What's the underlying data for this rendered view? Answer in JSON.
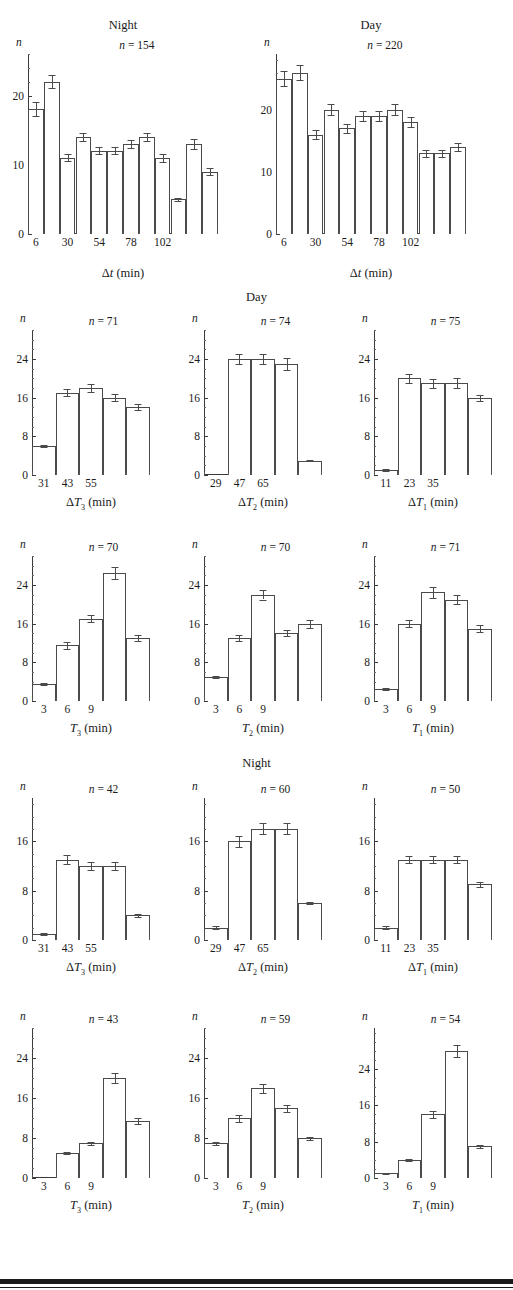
{
  "section_headings": [
    {
      "text": "Day",
      "row": 2
    },
    {
      "text": "Night",
      "row": 4
    }
  ],
  "axis_common": {
    "y_axis_label": "n",
    "n_prefix": "n",
    "n_equals": "="
  },
  "chart_data": [
    {
      "id": "night-dt",
      "type": "bar",
      "title": "Night",
      "n_label": "n = 154",
      "n_value": 154,
      "xlabel": "Δt (min)",
      "xlabel_html": "Δ<i>t</i> (min)",
      "ylabel": "n",
      "ylim": [
        0,
        26
      ],
      "yticks": [
        0,
        10,
        20
      ],
      "ytick_labels": [
        "0",
        "10",
        "20"
      ],
      "xticks": [
        6,
        30,
        54,
        78,
        102
      ],
      "xtick_labels": [
        "6",
        "30",
        "54",
        "78",
        "102"
      ],
      "x_min": 0,
      "x_max": 144,
      "bin_width": 12,
      "categories": [
        "0-12",
        "12-24",
        "24-36",
        "36-48",
        "48-60",
        "60-72",
        "72-84",
        "84-96",
        "96-108",
        "108-120",
        "120-132",
        "132-144"
      ],
      "values": [
        18,
        22,
        11,
        14,
        12,
        12,
        13,
        14,
        11,
        5,
        13,
        9
      ],
      "errors": [
        1.0,
        0.9,
        0.5,
        0.6,
        0.5,
        0.5,
        0.6,
        0.6,
        0.6,
        0.2,
        0.7,
        0.5
      ],
      "grid": false,
      "legend": "none"
    },
    {
      "id": "day-dt",
      "type": "bar",
      "title": "Day",
      "n_label": "n = 220",
      "n_value": 220,
      "xlabel": "Δt (min)",
      "xlabel_html": "Δ<i>t</i> (min)",
      "ylabel": "n",
      "ylim": [
        0,
        29
      ],
      "yticks": [
        0,
        10,
        20
      ],
      "ytick_labels": [
        "0",
        "10",
        "20"
      ],
      "xticks": [
        6,
        30,
        54,
        78,
        102
      ],
      "xtick_labels": [
        "6",
        "30",
        "54",
        "78",
        "102"
      ],
      "x_min": 0,
      "x_max": 144,
      "bin_width": 12,
      "categories": [
        "0-12",
        "12-24",
        "24-36",
        "36-48",
        "48-60",
        "60-72",
        "72-84",
        "84-96",
        "96-108",
        "108-120",
        "120-132",
        "132-144"
      ],
      "values": [
        25,
        26,
        16,
        20,
        17,
        19,
        19,
        20,
        18,
        13,
        13,
        14
      ],
      "errors": [
        1.2,
        1.2,
        0.7,
        0.9,
        0.7,
        0.8,
        0.8,
        0.9,
        0.8,
        0.6,
        0.6,
        0.7
      ],
      "grid": false,
      "legend": "none"
    },
    {
      "id": "day-dT3",
      "type": "bar",
      "title": "",
      "n_label": "n = 71",
      "n_value": 71,
      "xlabel": "ΔT3 (min)",
      "xlabel_html": "Δ<i>T</i><sub>3</sub> (min)",
      "ylabel": "n",
      "ylim": [
        0,
        30
      ],
      "yticks": [
        0,
        8,
        16,
        24
      ],
      "ytick_labels": [
        "0",
        "8",
        "16",
        "24"
      ],
      "xticks": [
        31,
        43,
        55
      ],
      "xtick_labels": [
        "31",
        "43",
        "55"
      ],
      "x_min": 25,
      "x_max": 85,
      "bin_width": 12,
      "categories": [
        "25-37",
        "37-49",
        "49-61",
        "61-73",
        "73-85"
      ],
      "values": [
        6,
        17,
        18,
        16,
        14
      ],
      "errors": [
        0.2,
        0.7,
        0.9,
        0.7,
        0.6
      ],
      "grid": false,
      "legend": "none"
    },
    {
      "id": "day-dT2",
      "type": "bar",
      "title": "",
      "n_label": "n = 74",
      "n_value": 74,
      "xlabel": "ΔT2 (min)",
      "xlabel_html": "Δ<i>T</i><sub>2</sub> (min)",
      "ylabel": "n",
      "ylim": [
        0,
        30
      ],
      "yticks": [
        0,
        8,
        16,
        24
      ],
      "ytick_labels": [
        "0",
        "8",
        "16",
        "24"
      ],
      "xticks": [
        29,
        47,
        65
      ],
      "xtick_labels": [
        "29",
        "47",
        "65"
      ],
      "x_min": 20,
      "x_max": 110,
      "bin_width": 18,
      "categories": [
        "20-38",
        "38-56",
        "56-74",
        "74-92",
        "92-110"
      ],
      "values": [
        0,
        24,
        24,
        23,
        3
      ],
      "errors": [
        0,
        1.0,
        1.1,
        1.2,
        0.2
      ],
      "grid": false,
      "legend": "none"
    },
    {
      "id": "day-dT1",
      "type": "bar",
      "title": "",
      "n_label": "n = 75",
      "n_value": 75,
      "xlabel": "ΔT1 (min)",
      "xlabel_html": "Δ<i>T</i><sub>1</sub> (min)",
      "ylabel": "n",
      "ylim": [
        0,
        30
      ],
      "yticks": [
        0,
        8,
        16,
        24
      ],
      "ytick_labels": [
        "0",
        "8",
        "16",
        "24"
      ],
      "xticks": [
        11,
        23,
        35
      ],
      "xtick_labels": [
        "11",
        "23",
        "35"
      ],
      "x_min": 5,
      "x_max": 65,
      "bin_width": 12,
      "categories": [
        "5-17",
        "17-29",
        "29-41",
        "41-53",
        "53-65"
      ],
      "values": [
        1,
        20,
        19,
        19,
        16
      ],
      "errors": [
        0.2,
        1.0,
        0.9,
        1.0,
        0.6
      ],
      "grid": false,
      "legend": "none"
    },
    {
      "id": "day-T3",
      "type": "bar",
      "title": "",
      "n_label": "n = 70",
      "n_value": 70,
      "xlabel": "T3 (min)",
      "xlabel_html": "<i>T</i><sub>3</sub> (min)",
      "ylabel": "n",
      "ylim": [
        0,
        30
      ],
      "yticks": [
        0,
        8,
        16,
        24
      ],
      "ytick_labels": [
        "0",
        "8",
        "16",
        "24"
      ],
      "xticks": [
        3,
        6,
        9
      ],
      "xtick_labels": [
        "3",
        "6",
        "9"
      ],
      "x_min": 1.5,
      "x_max": 16.5,
      "bin_width": 3,
      "categories": [
        "1.5-4.5",
        "4.5-7.5",
        "7.5-10.5",
        "10.5-13.5",
        "13.5-16.5"
      ],
      "values": [
        3.5,
        11.5,
        17,
        26.5,
        13
      ],
      "errors": [
        0.2,
        0.7,
        0.7,
        1.2,
        0.6
      ],
      "grid": false,
      "legend": "none"
    },
    {
      "id": "day-T2",
      "type": "bar",
      "title": "",
      "n_label": "n = 70",
      "n_value": 70,
      "xlabel": "T2 (min)",
      "xlabel_html": "<i>T</i><sub>2</sub> (min)",
      "ylabel": "n",
      "ylim": [
        0,
        30
      ],
      "yticks": [
        0,
        8,
        16,
        24
      ],
      "ytick_labels": [
        "0",
        "8",
        "16",
        "24"
      ],
      "xticks": [
        3,
        6,
        9
      ],
      "xtick_labels": [
        "3",
        "6",
        "9"
      ],
      "x_min": 1.5,
      "x_max": 16.5,
      "bin_width": 3,
      "categories": [
        "1.5-4.5",
        "4.5-7.5",
        "7.5-10.5",
        "10.5-13.5",
        "13.5-16.5"
      ],
      "values": [
        5,
        13,
        22,
        14,
        16
      ],
      "errors": [
        0.2,
        0.6,
        1.0,
        0.6,
        0.8
      ],
      "grid": false,
      "legend": "none"
    },
    {
      "id": "day-T1",
      "type": "bar",
      "title": "",
      "n_label": "n = 71",
      "n_value": 71,
      "xlabel": "T1 (min)",
      "xlabel_html": "<i>T</i><sub>1</sub> (min)",
      "ylabel": "n",
      "ylim": [
        0,
        30
      ],
      "yticks": [
        0,
        8,
        16,
        24
      ],
      "ytick_labels": [
        "0",
        "8",
        "16",
        "24"
      ],
      "xticks": [
        3,
        6,
        9
      ],
      "xtick_labels": [
        "3",
        "6",
        "9"
      ],
      "x_min": 1.5,
      "x_max": 16.5,
      "bin_width": 3,
      "categories": [
        "1.5-4.5",
        "4.5-7.5",
        "7.5-10.5",
        "10.5-13.5",
        "13.5-16.5"
      ],
      "values": [
        2.5,
        16,
        22.5,
        21,
        15
      ],
      "errors": [
        0.2,
        0.7,
        1.1,
        1.0,
        0.7
      ],
      "grid": false,
      "legend": "none"
    },
    {
      "id": "night-dT3",
      "type": "bar",
      "title": "",
      "n_label": "n = 42",
      "n_value": 42,
      "xlabel": "ΔT3 (min)",
      "xlabel_html": "Δ<i>T</i><sub>3</sub> (min)",
      "ylabel": "n",
      "ylim": [
        0,
        23
      ],
      "yticks": [
        0,
        8,
        16
      ],
      "ytick_labels": [
        "0",
        "8",
        "16"
      ],
      "xticks": [
        31,
        43,
        55
      ],
      "xtick_labels": [
        "31",
        "43",
        "55"
      ],
      "x_min": 25,
      "x_max": 85,
      "bin_width": 12,
      "categories": [
        "25-37",
        "37-49",
        "49-61",
        "61-73",
        "73-85"
      ],
      "values": [
        1,
        13,
        12,
        12,
        4
      ],
      "errors": [
        0.15,
        0.7,
        0.6,
        0.6,
        0.2
      ],
      "grid": false,
      "legend": "none"
    },
    {
      "id": "night-dT2",
      "type": "bar",
      "title": "",
      "n_label": "n = 60",
      "n_value": 60,
      "xlabel": "ΔT2 (min)",
      "xlabel_html": "Δ<i>T</i><sub>2</sub> (min)",
      "ylabel": "n",
      "ylim": [
        0,
        23
      ],
      "yticks": [
        0,
        8,
        16
      ],
      "ytick_labels": [
        "0",
        "8",
        "16"
      ],
      "xticks": [
        29,
        47,
        65
      ],
      "xtick_labels": [
        "29",
        "47",
        "65"
      ],
      "x_min": 20,
      "x_max": 110,
      "bin_width": 18,
      "categories": [
        "20-38",
        "38-56",
        "56-74",
        "74-92",
        "92-110"
      ],
      "values": [
        2,
        16,
        18,
        18,
        6
      ],
      "errors": [
        0.2,
        0.9,
        0.9,
        0.9,
        0.2
      ],
      "grid": false,
      "legend": "none"
    },
    {
      "id": "night-dT1",
      "type": "bar",
      "title": "",
      "n_label": "n = 50",
      "n_value": 50,
      "xlabel": "ΔT1 (min)",
      "xlabel_html": "Δ<i>T</i><sub>1</sub> (min)",
      "ylabel": "n",
      "ylim": [
        0,
        23
      ],
      "yticks": [
        0,
        8,
        16
      ],
      "ytick_labels": [
        "0",
        "8",
        "16"
      ],
      "xticks": [
        11,
        23,
        35
      ],
      "xtick_labels": [
        "11",
        "23",
        "35"
      ],
      "x_min": 5,
      "x_max": 65,
      "bin_width": 12,
      "categories": [
        "5-17",
        "17-29",
        "29-41",
        "41-53",
        "53-65"
      ],
      "values": [
        2,
        13,
        13,
        13,
        9
      ],
      "errors": [
        0.2,
        0.6,
        0.6,
        0.6,
        0.4
      ],
      "grid": false,
      "legend": "none"
    },
    {
      "id": "night-T3",
      "type": "bar",
      "title": "",
      "n_label": "n = 43",
      "n_value": 43,
      "xlabel": "T3 (min)",
      "xlabel_html": "<i>T</i><sub>3</sub> (min)",
      "ylabel": "n",
      "ylim": [
        0,
        30
      ],
      "yticks": [
        0,
        8,
        16,
        24
      ],
      "ytick_labels": [
        "0",
        "8",
        "16",
        "24"
      ],
      "xticks": [
        3,
        6,
        9
      ],
      "xtick_labels": [
        "3",
        "6",
        "9"
      ],
      "x_min": 1.5,
      "x_max": 16.5,
      "bin_width": 3,
      "categories": [
        "1.5-4.5",
        "4.5-7.5",
        "7.5-10.5",
        "10.5-13.5",
        "13.5-16.5"
      ],
      "values": [
        0,
        5,
        7,
        20,
        11.5
      ],
      "errors": [
        0,
        0.2,
        0.3,
        1.0,
        0.6
      ],
      "grid": false,
      "legend": "none"
    },
    {
      "id": "night-T2",
      "type": "bar",
      "title": "",
      "n_label": "n = 59",
      "n_value": 59,
      "xlabel": "T2 (min)",
      "xlabel_html": "<i>T</i><sub>2</sub> (min)",
      "ylabel": "n",
      "ylim": [
        0,
        30
      ],
      "yticks": [
        0,
        8,
        16,
        24
      ],
      "ytick_labels": [
        "0",
        "8",
        "16",
        "24"
      ],
      "xticks": [
        3,
        6,
        9
      ],
      "xtick_labels": [
        "3",
        "6",
        "9"
      ],
      "x_min": 1.5,
      "x_max": 16.5,
      "bin_width": 3,
      "categories": [
        "1.5-4.5",
        "4.5-7.5",
        "7.5-10.5",
        "10.5-13.5",
        "13.5-16.5"
      ],
      "values": [
        7,
        12,
        18,
        14,
        8
      ],
      "errors": [
        0.3,
        0.7,
        0.9,
        0.7,
        0.3
      ],
      "grid": false,
      "legend": "none"
    },
    {
      "id": "night-T1",
      "type": "bar",
      "title": "",
      "n_label": "n = 54",
      "n_value": 54,
      "xlabel": "T1 (min)",
      "xlabel_html": "<i>T</i><sub>1</sub> (min)",
      "ylabel": "n",
      "ylim": [
        0,
        33
      ],
      "yticks": [
        0,
        8,
        16,
        24
      ],
      "ytick_labels": [
        "0",
        "8",
        "16",
        "24"
      ],
      "xticks": [
        3,
        6,
        9
      ],
      "xtick_labels": [
        "3",
        "6",
        "9"
      ],
      "x_min": 1.5,
      "x_max": 16.5,
      "bin_width": 3,
      "categories": [
        "1.5-4.5",
        "4.5-7.5",
        "7.5-10.5",
        "10.5-13.5",
        "13.5-16.5"
      ],
      "values": [
        1,
        4,
        14,
        28,
        7
      ],
      "errors": [
        0.15,
        0.2,
        0.7,
        1.3,
        0.3
      ],
      "grid": false,
      "legend": "none"
    }
  ]
}
